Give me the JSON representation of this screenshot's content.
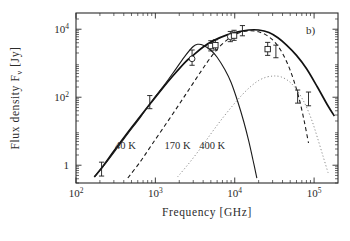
{
  "figure": {
    "panel_label": "b)",
    "background_color": "#ffffff",
    "foreground_color": "#2b2b2b"
  },
  "chart_data": {
    "type": "line",
    "title": "",
    "subtitle": "",
    "xlabel": "Frequency   [GHz]",
    "ylabel": "Flux density Fν  [Jy]",
    "ylabel_parts": {
      "lead": "Flux density F",
      "sub": "ν",
      "trail": " [Jy]"
    },
    "xscale": "log",
    "yscale": "log",
    "xlim": [
      100,
      200000
    ],
    "ylim": [
      0.3,
      30000
    ],
    "grid": false,
    "legend_position": "inline-annotations",
    "xticks": [
      100,
      1000,
      10000,
      100000
    ],
    "xtick_labels": [
      "10²",
      "10³",
      "10⁴",
      "10⁵"
    ],
    "xtick_mantissas": [
      "10",
      "10",
      "10",
      "10"
    ],
    "xtick_exponents": [
      "2",
      "3",
      "4",
      "5"
    ],
    "yticks": [
      1,
      100,
      10000
    ],
    "ytick_labels": [
      "1",
      "10²",
      "10⁴"
    ],
    "ytick_mantissas": [
      "1",
      "10",
      "10"
    ],
    "ytick_exponents": [
      "",
      "2",
      "4"
    ],
    "annotations": [
      {
        "text": "40 K",
        "x": 420,
        "y": 3.0,
        "component": "greybody-40K"
      },
      {
        "text": "170 K",
        "x": 1900,
        "y": 3.0,
        "component": "greybody-170K"
      },
      {
        "text": "400 K",
        "x": 5200,
        "y": 3.0,
        "component": "greybody-400K"
      },
      {
        "text": "b)",
        "x": 90000,
        "y": 7000,
        "component": "panel-label"
      }
    ],
    "series": [
      {
        "name": "Total (sum of components)",
        "style": "solid-thick",
        "color": "#111111",
        "temperature_K": null,
        "x": [
          170,
          220,
          300,
          420,
          600,
          850,
          1200,
          1700,
          2400,
          3000,
          4000,
          5500,
          8000,
          11000,
          15000,
          20000,
          27000,
          35000,
          45000,
          60000,
          80000,
          110000,
          150000,
          180000
        ],
        "y": [
          0.45,
          0.95,
          2.6,
          7.5,
          22,
          62,
          170,
          450,
          1100,
          1700,
          3000,
          4700,
          6800,
          8400,
          9500,
          9500,
          8000,
          5600,
          3400,
          1700,
          700,
          200,
          55,
          28
        ]
      },
      {
        "name": "Grey body 40 K",
        "style": "solid",
        "color": "#1a1a1a",
        "temperature_K": 40,
        "peak_x": 3400,
        "peak_y": 3600,
        "x": [
          170,
          230,
          320,
          450,
          650,
          900,
          1300,
          1800,
          2400,
          3000,
          3400,
          4000,
          5000,
          6000,
          7500,
          9000,
          11000,
          13000,
          15000,
          17000,
          19000
        ],
        "y": [
          0.45,
          1.05,
          2.9,
          8.5,
          26,
          76,
          230,
          660,
          1700,
          3100,
          3600,
          3400,
          2400,
          1500,
          650,
          270,
          70,
          19,
          5.2,
          1.4,
          0.42
        ]
      },
      {
        "name": "Grey body 170 K",
        "style": "dashed",
        "color": "#1a1a1a",
        "temperature_K": 170,
        "peak_x": 16000,
        "peak_y": 9000,
        "x": [
          450,
          650,
          900,
          1300,
          1900,
          2700,
          3800,
          5200,
          7000,
          9500,
          12500,
          16000,
          20000,
          25000,
          31000,
          38000,
          46000,
          55000,
          65000,
          75000,
          85000
        ],
        "y": [
          0.42,
          1.3,
          4.0,
          14,
          52,
          180,
          600,
          1700,
          3700,
          6400,
          8400,
          9000,
          8400,
          6700,
          4500,
          2400,
          1000,
          330,
          88,
          20,
          4.5
        ]
      },
      {
        "name": "Grey body 400 K",
        "style": "dotted",
        "color": "#8d8d8d",
        "temperature_K": 400,
        "peak_x": 33000,
        "peak_y": 420,
        "x": [
          1900,
          2700,
          3800,
          5200,
          7000,
          9500,
          12500,
          16000,
          20000,
          25000,
          30000,
          33000,
          38000,
          45000,
          52000,
          60000,
          70000,
          80000,
          95000,
          110000,
          130000,
          150000
        ],
        "y": [
          0.45,
          1.2,
          3.4,
          9.5,
          24,
          58,
          120,
          210,
          310,
          390,
          418,
          420,
          400,
          330,
          250,
          170,
          95,
          52,
          19,
          6.5,
          1.8,
          0.6
        ]
      }
    ],
    "data_points": [
      {
        "x": 210,
        "y": 0.78,
        "y_err_low": 0.3,
        "y_err_high": 0.45,
        "marker": "bar"
      },
      {
        "x": 850,
        "y": 72,
        "y_err_low": 26,
        "y_err_high": 40,
        "marker": "bar"
      },
      {
        "x": 2900,
        "y": 1350,
        "y_err_low": 480,
        "y_err_high": 1100,
        "marker": "circle"
      },
      {
        "x": 5000,
        "y": 3200,
        "y_err_low": 900,
        "y_err_high": 1400,
        "marker": "square"
      },
      {
        "x": 5700,
        "y": 3400,
        "y_err_low": 950,
        "y_err_high": 1500,
        "marker": "square"
      },
      {
        "x": 8800,
        "y": 6000,
        "y_err_low": 1700,
        "y_err_high": 2600,
        "marker": "circle"
      },
      {
        "x": 9800,
        "y": 6500,
        "y_err_low": 1800,
        "y_err_high": 2800,
        "marker": "square"
      },
      {
        "x": 12500,
        "y": 9000,
        "y_err_low": 2600,
        "y_err_high": 3800,
        "marker": "bar"
      },
      {
        "x": 26000,
        "y": 2600,
        "y_err_low": 900,
        "y_err_high": 1500,
        "marker": "square"
      },
      {
        "x": 33000,
        "y": 2200,
        "y_err_low": 750,
        "y_err_high": 1200,
        "marker": "bar"
      },
      {
        "x": 62000,
        "y": 105,
        "y_err_low": 38,
        "y_err_high": 58,
        "marker": "bar"
      },
      {
        "x": 85000,
        "y": 90,
        "y_err_low": 34,
        "y_err_high": 52,
        "marker": "bar"
      }
    ]
  }
}
